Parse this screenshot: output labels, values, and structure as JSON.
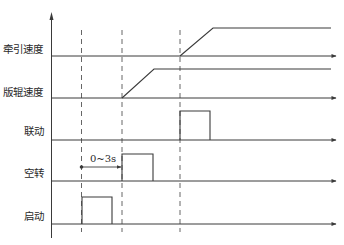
{
  "diagram": {
    "type": "timing-diagram",
    "colors": {
      "line": "#3a3a3a",
      "dashed": "#555555",
      "text": "#2a2a2a",
      "background": "#ffffff"
    },
    "signals": [
      {
        "id": "traction-speed",
        "label": "牵引速度",
        "kind": "ramp",
        "baseline_y": 56
      },
      {
        "id": "plate-roller-speed",
        "label": "版辊速度",
        "kind": "ramp",
        "baseline_y": 98
      },
      {
        "id": "linkage",
        "label": "联动",
        "kind": "pulse",
        "baseline_y": 140
      },
      {
        "id": "idle",
        "label": "空转",
        "kind": "pulse",
        "baseline_y": 181
      },
      {
        "id": "start",
        "label": "启动",
        "kind": "pulse",
        "baseline_y": 224
      }
    ],
    "annotation": {
      "label": "0~3s",
      "from_marker": "t1",
      "to_marker": "t2"
    },
    "time_markers": [
      {
        "id": "t1",
        "x": 81
      },
      {
        "id": "t2",
        "x": 122
      },
      {
        "id": "t3",
        "x": 180
      }
    ]
  }
}
